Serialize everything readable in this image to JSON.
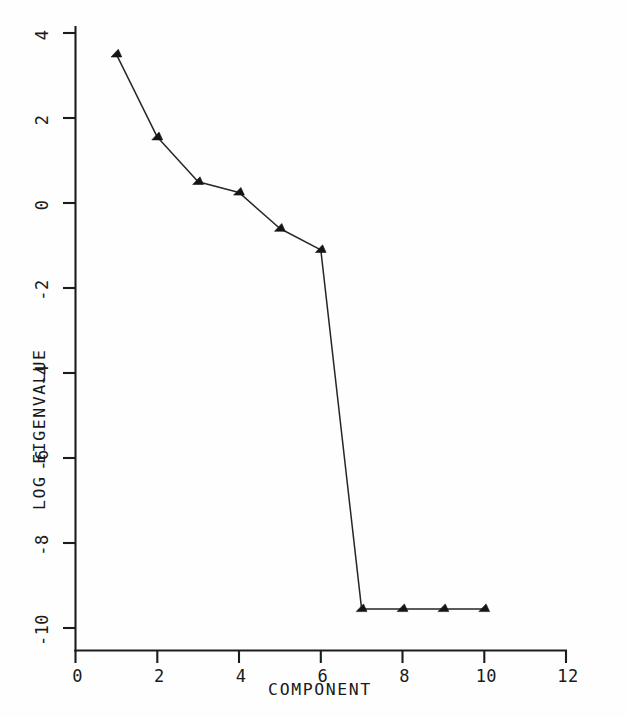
{
  "chart_data": {
    "type": "line",
    "title": "",
    "xlabel": "COMPONENT",
    "ylabel": "LOG EIGENVALUE",
    "xlim": [
      0,
      12
    ],
    "ylim": [
      -10,
      4
    ],
    "grid": false,
    "legend": null,
    "x": [
      1,
      2,
      3,
      4,
      5,
      6,
      7,
      8,
      9,
      10
    ],
    "values": [
      3.5,
      1.55,
      0.5,
      0.25,
      -0.6,
      -1.1,
      -9.55,
      -9.55,
      -9.55,
      -9.55
    ],
    "series": [
      {
        "name": "log eigenvalue",
        "values": [
          3.5,
          1.55,
          0.5,
          0.25,
          -0.6,
          -1.1,
          -9.55,
          -9.55,
          -9.55,
          -9.55
        ]
      }
    ],
    "marker": "triangle",
    "xticks": [
      0,
      2,
      4,
      6,
      8,
      10,
      12
    ],
    "xtick_labels": [
      "0",
      "2",
      "4",
      "6",
      "8",
      "10",
      "12"
    ],
    "yticks": [
      4,
      2,
      0,
      -2,
      -4,
      -6,
      -8,
      -10
    ],
    "ytick_labels": [
      "4",
      "2",
      "0",
      "-2",
      "-4",
      "-6",
      "-8",
      "-10"
    ]
  },
  "axes": {
    "y_title": "LOG EIGENVALUE",
    "x_title": "COMPONENT",
    "y_tick_labels": [
      {
        "value": 4,
        "text": "4"
      },
      {
        "value": 2,
        "text": "2"
      },
      {
        "value": 0,
        "text": "0"
      },
      {
        "value": -2,
        "text": "-2"
      },
      {
        "value": -4,
        "text": "-4"
      },
      {
        "value": -6,
        "text": "-6"
      },
      {
        "value": -8,
        "text": "-8"
      },
      {
        "value": -10,
        "text": "-10"
      }
    ],
    "x_tick_labels": [
      {
        "value": 0,
        "text": "0"
      },
      {
        "value": 2,
        "text": "2"
      },
      {
        "value": 4,
        "text": "4"
      },
      {
        "value": 6,
        "text": "6"
      },
      {
        "value": 8,
        "text": "8"
      },
      {
        "value": 10,
        "text": "10"
      },
      {
        "value": 12,
        "text": "12"
      }
    ]
  },
  "style": {
    "background": "#fefefe",
    "ink": "#1a1a1a",
    "line_color": "#262626",
    "marker_color": "#151515"
  }
}
